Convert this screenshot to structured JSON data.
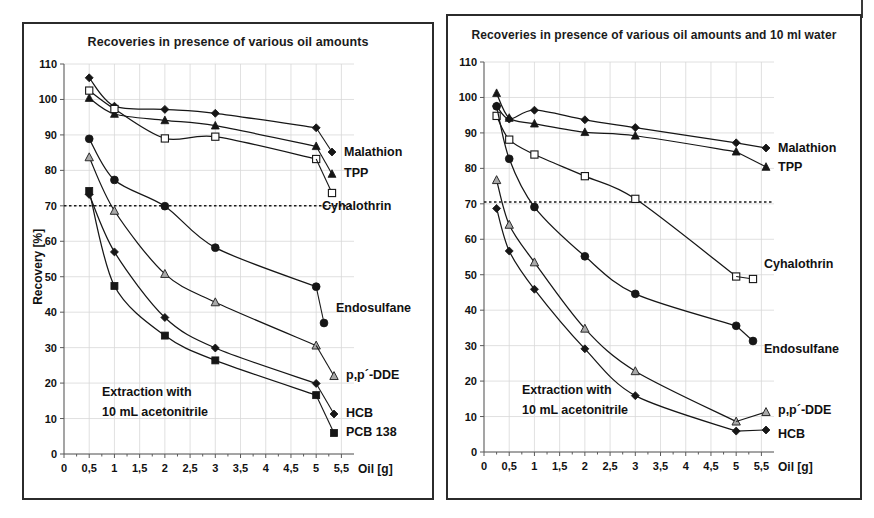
{
  "figure": {
    "background": "#ffffff",
    "frame_color": "#2b2b2b",
    "threshold_label": "70 % recovery threshold"
  },
  "chart_data": [
    {
      "type": "line",
      "panel": "left",
      "title": "Recoveries in presence of various oil amounts",
      "xlabel": "Oil [g]",
      "ylabel": "Recovery [%]",
      "xlim": [
        0,
        5.75
      ],
      "ylim": [
        0,
        110
      ],
      "xticks": [
        0,
        0.5,
        1,
        1.5,
        2,
        2.5,
        3,
        3.5,
        4,
        4.5,
        5,
        5.5
      ],
      "xticklabels": [
        "0",
        "0,5",
        "1",
        "1,5",
        "2",
        "2,5",
        "3",
        "3,5",
        "4",
        "4,5",
        "5",
        "5,5"
      ],
      "yticks": [
        0,
        10,
        20,
        30,
        40,
        50,
        60,
        70,
        80,
        90,
        100,
        110
      ],
      "yticklabels": [
        "0",
        "10",
        "20",
        "30",
        "40",
        "50",
        "60",
        "70",
        "80",
        "90",
        "100",
        "110"
      ],
      "grid": true,
      "legend_position": "inline-right",
      "threshold": 70,
      "annotation": [
        "Extraction with",
        "10 mL acetonitrile"
      ],
      "x": [
        0.5,
        1,
        2,
        3,
        5
      ],
      "series": [
        {
          "name": "Malathion",
          "marker": "filled-diamond",
          "values": [
            106.1,
            98.1,
            97.2,
            96.1,
            92.0
          ]
        },
        {
          "name": "TPP",
          "marker": "filled-triangle",
          "values": [
            100.4,
            95.9,
            94.1,
            92.6,
            86.8
          ]
        },
        {
          "name": "Cyhalothrin",
          "marker": "open-square",
          "values": [
            102.5,
            97.3,
            89.0,
            89.5,
            83.2
          ]
        },
        {
          "name": "Endosulfane",
          "marker": "filled-circle",
          "values": [
            88.9,
            77.3,
            69.9,
            58.2,
            47.2
          ]
        },
        {
          "name": "p,p´-DDE",
          "marker": "grey-triangle",
          "values": [
            83.7,
            68.6,
            50.8,
            42.8,
            30.6
          ]
        },
        {
          "name": "HCB",
          "marker": "filled-diamond",
          "values": [
            73.2,
            57.0,
            38.5,
            29.9,
            19.9
          ]
        },
        {
          "name": "PCB 138",
          "marker": "filled-square",
          "values": [
            74.2,
            47.4,
            33.4,
            26.4,
            16.6
          ]
        }
      ]
    },
    {
      "type": "line",
      "panel": "right",
      "title": "Recoveries in presence of various oil amounts and 10 ml water",
      "xlabel": "Oil [g]",
      "ylabel": "Recovery [%]",
      "xlim": [
        0,
        5.75
      ],
      "ylim": [
        0,
        110
      ],
      "xticks": [
        0,
        0.5,
        1,
        1.5,
        2,
        2.5,
        3,
        3.5,
        4,
        4.5,
        5,
        5.5
      ],
      "xticklabels": [
        "0",
        "0,5",
        "1",
        "1,5",
        "2",
        "2,5",
        "3",
        "3,5",
        "4",
        "4,5",
        "5",
        "5,5"
      ],
      "yticks": [
        0,
        10,
        20,
        30,
        40,
        50,
        60,
        70,
        80,
        90,
        100,
        110
      ],
      "yticklabels": [
        "0",
        "10",
        "20",
        "30",
        "40",
        "50",
        "60",
        "70",
        "80",
        "90",
        "100",
        "110"
      ],
      "grid": true,
      "legend_position": "inline-right",
      "threshold": 70.5,
      "annotation": [
        "Extraction with",
        "10 mL acetonitrile"
      ],
      "x": [
        0.25,
        0.5,
        1,
        2,
        3,
        5
      ],
      "series": [
        {
          "name": "Malathion",
          "marker": "filled-diamond",
          "values": [
            97.6,
            93.9,
            96.4,
            93.7,
            91.5,
            87.2
          ]
        },
        {
          "name": "TPP",
          "marker": "filled-triangle",
          "values": [
            101.2,
            94.2,
            92.6,
            90.2,
            89.2,
            84.7
          ]
        },
        {
          "name": "Cyhalothrin",
          "marker": "open-square",
          "values": [
            94.8,
            88.1,
            83.9,
            77.8,
            71.4,
            49.5
          ]
        },
        {
          "name": "Endosulfane",
          "marker": "filled-circle",
          "values": [
            97.5,
            82.7,
            69.1,
            55.2,
            44.6,
            35.6
          ]
        },
        {
          "name": "p,p´-DDE",
          "marker": "grey-triangle",
          "values": [
            76.7,
            64.1,
            53.5,
            34.8,
            22.8,
            8.6
          ]
        },
        {
          "name": "HCB",
          "marker": "filled-diamond",
          "values": [
            68.7,
            56.7,
            45.9,
            29.1,
            15.9,
            5.9
          ]
        }
      ]
    }
  ],
  "left_panel": {
    "title": "Recoveries in presence of various oil amounts",
    "xlabel": "Oil [g]",
    "ylabel": "Recovery [%]",
    "xticklabels": [
      "0",
      "0,5",
      "1",
      "1,5",
      "2",
      "2,5",
      "3",
      "3,5",
      "4",
      "4,5",
      "5",
      "5,5"
    ],
    "yticklabels": [
      "0",
      "10",
      "20",
      "30",
      "40",
      "50",
      "60",
      "70",
      "80",
      "90",
      "100",
      "110"
    ],
    "note_line1": "Extraction with",
    "note_line2": "10 mL acetonitrile",
    "labels": {
      "malathion": "Malathion",
      "tpp": "TPP",
      "cyhalothrin": "Cyhalothrin",
      "endosulfane": "Endosulfane",
      "ddE": "p,p´-DDE",
      "hcb": "HCB",
      "pcb": "PCB 138"
    }
  },
  "right_panel": {
    "title": "Recoveries in presence of various oil amounts and 10 ml water",
    "xlabel": "Oil [g]",
    "ylabel": "Recovery [%]",
    "xticklabels": [
      "0",
      "0,5",
      "1",
      "1,5",
      "2",
      "2,5",
      "3",
      "3,5",
      "4",
      "4,5",
      "5",
      "5,5"
    ],
    "yticklabels": [
      "0",
      "10",
      "20",
      "30",
      "40",
      "50",
      "60",
      "70",
      "80",
      "90",
      "100",
      "110"
    ],
    "note_line1": "Extraction with",
    "note_line2": "10 mL acetonitrile",
    "labels": {
      "malathion": "Malathion",
      "tpp": "TPP",
      "cyhalothrin": "Cyhalothrin",
      "endosulfane": "Endosulfane",
      "ddE": "p,p´-DDE",
      "hcb": "HCB"
    }
  }
}
